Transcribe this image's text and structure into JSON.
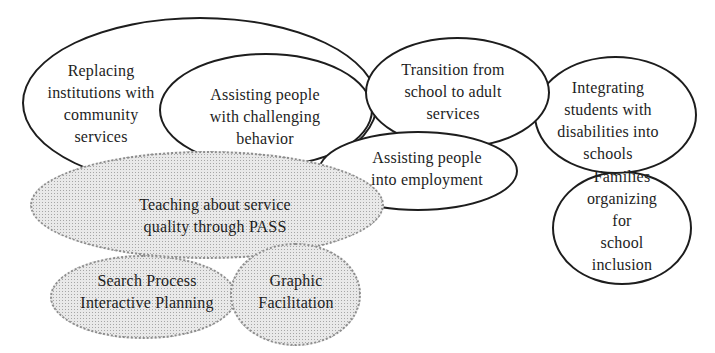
{
  "diagram": {
    "colors": {
      "paper": "#ffffff",
      "ink": "#1d1d1d",
      "stipple_fill": "#e9e9e9",
      "stipple_dot": "#a6a6a6",
      "stipple_edge": "#8d8d8d"
    },
    "bubbles": [
      {
        "id": "replacing-institutions",
        "fill": "plain",
        "label": "Replacing\ninstitutions with\ncommunity\nservices"
      },
      {
        "id": "challenging-behavior",
        "fill": "plain",
        "label": "Assisting people\nwith challenging\nbehavior"
      },
      {
        "id": "transition-school",
        "fill": "plain",
        "label": "Transition from\nschool to adult\nservices"
      },
      {
        "id": "employment",
        "fill": "plain",
        "label": "Assisting people\ninto employment"
      },
      {
        "id": "teaching-pass",
        "fill": "stipple",
        "label": "Teaching about service\nquality through PASS"
      },
      {
        "id": "search-process",
        "fill": "stipple",
        "label": "Search Process\nInteractive Planning"
      },
      {
        "id": "graphic-facilitation",
        "fill": "stipple",
        "label": "Graphic\nFacilitation"
      },
      {
        "id": "integrating-students",
        "fill": "plain",
        "label": "Integrating\nstudents with\ndisabilities into\nschools"
      },
      {
        "id": "families-organizing",
        "fill": "plain",
        "label": "Families\norganizing for\nschool inclusion"
      }
    ]
  }
}
